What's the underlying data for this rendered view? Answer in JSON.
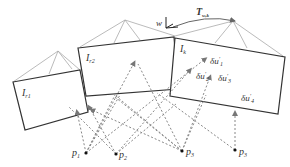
{
  "diagram": {
    "type": "multi-view camera projection schematic",
    "frames": [
      {
        "id": "Ir1",
        "label": "I",
        "sub": "r1"
      },
      {
        "id": "Ir2",
        "label": "I",
        "sub": "r2"
      },
      {
        "id": "Ik",
        "label": "I",
        "sub": "k"
      }
    ],
    "transform": {
      "label": "T",
      "sub": "w,k"
    },
    "world_frame": {
      "label": "w"
    },
    "residuals": [
      {
        "label": "δu",
        "sup": "′",
        "sub": "1"
      },
      {
        "label": "δu",
        "sup": "′",
        "sub": "2"
      },
      {
        "label": "δu",
        "sup": "′",
        "sub": "3"
      },
      {
        "label": "δu",
        "sup": "′",
        "sub": "4"
      }
    ],
    "points": [
      {
        "label": "p",
        "sub": "1"
      },
      {
        "label": "p",
        "sub": "2"
      },
      {
        "label": "p",
        "sub": "3"
      },
      {
        "label": "p",
        "sub": "3"
      }
    ],
    "colors": {
      "frame_border": "#333333",
      "frustum": "#aaaaaa",
      "ray": "#888888",
      "point": "#111111"
    }
  }
}
